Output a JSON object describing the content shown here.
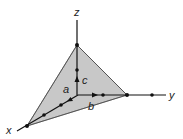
{
  "diagram": {
    "axes": {
      "x": {
        "label": "x"
      },
      "y": {
        "label": "y"
      },
      "z": {
        "label": "z"
      }
    },
    "vectors": {
      "a": {
        "label": "a"
      },
      "b": {
        "label": "b"
      },
      "c": {
        "label": "c"
      }
    },
    "colors": {
      "plane_fill": "#c8c8c8",
      "line": "#111111",
      "background": "#ffffff"
    }
  }
}
